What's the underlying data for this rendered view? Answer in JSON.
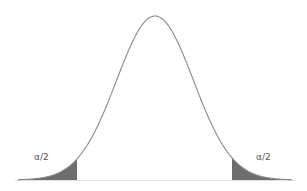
{
  "diagram": {
    "type": "normal-distribution-two-tailed",
    "labels": {
      "left_tail": "α/2",
      "right_tail": "α/2"
    },
    "colors": {
      "curve": "#888888",
      "shade": "#6e6e6e",
      "baseline": "#dddddd"
    }
  },
  "chart_data": {
    "type": "area",
    "title": "",
    "xlabel": "",
    "ylabel": "",
    "series": [
      {
        "name": "density",
        "distribution": "normal",
        "mean": 0,
        "sd": 1
      }
    ],
    "shaded_regions": [
      {
        "side": "left",
        "label": "α/2"
      },
      {
        "side": "right",
        "label": "α/2"
      }
    ],
    "annotations": [
      "α/2",
      "α/2"
    ],
    "grid": false,
    "legend": null
  }
}
